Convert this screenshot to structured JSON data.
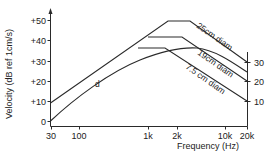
{
  "chart_data": {
    "type": "line",
    "title": "",
    "xlabel": "Frequency (Hz)",
    "ylabel": "Velocity (dB ref 1cm/s)",
    "x_scale": "log",
    "xlim": [
      30,
      20000
    ],
    "ylim": [
      0,
      50
    ],
    "x_ticks": [
      "30",
      "100",
      "1k",
      "2k",
      "10k",
      "20k"
    ],
    "y_ticks": [
      "0",
      "+10",
      "+20",
      "+30",
      "+40",
      "+50"
    ],
    "right_axis_ticks": [
      "10",
      "20",
      "30"
    ],
    "grid": false,
    "legend": "inline labels along curves",
    "series": [
      {
        "name": "25cm diam",
        "points": [
          [
            30,
            9
          ],
          [
            1700,
            50
          ],
          [
            2800,
            50
          ],
          [
            20000,
            30
          ]
        ]
      },
      {
        "name": "19cm diam",
        "points": [
          [
            30,
            9
          ],
          [
            1000,
            42
          ],
          [
            2500,
            42
          ],
          [
            20000,
            20
          ]
        ]
      },
      {
        "name": "7.5 cm diam",
        "points": [
          [
            30,
            9
          ],
          [
            700,
            36.5
          ],
          [
            1500,
            36.5
          ],
          [
            20000,
            10
          ]
        ]
      },
      {
        "name": "d",
        "points": [
          [
            30,
            0
          ],
          [
            100,
            14
          ],
          [
            300,
            25
          ],
          [
            1000,
            33
          ],
          [
            2000,
            36.5
          ],
          [
            3000,
            37
          ],
          [
            5000,
            34
          ],
          [
            10000,
            29
          ],
          [
            20000,
            24.5
          ]
        ]
      }
    ]
  },
  "axes": {
    "y_label": "Velocity (dB ref 1cm/s)",
    "x_label": "Frequency (Hz)",
    "y_ticks": [
      {
        "label": "+50",
        "y": 20
      },
      {
        "label": "+40",
        "y": 40
      },
      {
        "label": "+30",
        "y": 61
      },
      {
        "label": "+20",
        "y": 81
      },
      {
        "label": "+10",
        "y": 101
      },
      {
        "label": "0",
        "y": 121
      }
    ],
    "x_ticks": [
      {
        "label": "30",
        "x": 51
      },
      {
        "label": "100",
        "x": 79
      },
      {
        "label": "1k",
        "x": 148
      },
      {
        "label": "2k",
        "x": 177
      },
      {
        "label": "10k",
        "x": 225
      },
      {
        "label": "20k",
        "x": 247
      }
    ],
    "right_ticks": [
      {
        "label": "30",
        "y": 62
      },
      {
        "label": "20",
        "y": 81
      },
      {
        "label": "10",
        "y": 101
      }
    ]
  },
  "labels": {
    "s25": "25cm diam",
    "s19": "19cm diam",
    "s75": "7.5 cm diam",
    "d": "d"
  }
}
